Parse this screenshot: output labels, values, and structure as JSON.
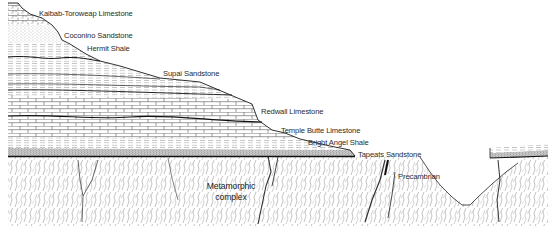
{
  "diagram": {
    "type": "geologic-cross-section",
    "colors": {
      "ink": "#1a1a1a",
      "background": "#ffffff",
      "stipple": "#8a8a8a"
    },
    "labels": [
      {
        "id": "kaibab",
        "text": "Kaibab-Toroweap Limestone",
        "x": 39,
        "y": 14
      },
      {
        "id": "coconino",
        "text": "Coconino Sandstone",
        "x": 64,
        "y": 36
      },
      {
        "id": "hermit",
        "text": "Hermit Shale",
        "x": 87,
        "y": 49
      },
      {
        "id": "supai",
        "text": "Supai Sandstone",
        "x": 163,
        "y": 74
      },
      {
        "id": "redwall",
        "text": "Redwall Limestone",
        "x": 261,
        "y": 112
      },
      {
        "id": "temple-butte",
        "text": "Temple Butte Limestone",
        "x": 281,
        "y": 131
      },
      {
        "id": "bright-angel",
        "text": "Bright Angel Shale",
        "x": 308,
        "y": 143
      },
      {
        "id": "tapeats",
        "text": "Tapeats Sandstone",
        "x": 358,
        "y": 155
      },
      {
        "id": "precambrian",
        "text": "Precambrian",
        "x": 398,
        "y": 177
      },
      {
        "id": "metamorphic",
        "text": "Metamorphic\ncomplex",
        "x": 205,
        "y": 183
      }
    ],
    "labels_text": {
      "kaibab": "Kaibab-Toroweap Limestone",
      "coconino": "Coconino Sandstone",
      "hermit": "Hermit Shale",
      "supai": "Supai Sandstone",
      "redwall": "Redwall Limestone",
      "temple_butte": "Temple Butte Limestone",
      "bright_angel": "Bright Angel Shale",
      "tapeats": "Tapeats Sandstone",
      "precambrian": "Precambrian",
      "metamorphic_line1": "Metamorphic",
      "metamorphic_line2": "complex"
    },
    "strata_top_to_bottom": [
      "Kaibab-Toroweap Limestone",
      "Coconino Sandstone",
      "Hermit Shale",
      "Supai Sandstone",
      "Redwall Limestone",
      "Temple Butte Limestone",
      "Bright Angel Shale",
      "Tapeats Sandstone",
      "Precambrian (Metamorphic complex)"
    ]
  }
}
